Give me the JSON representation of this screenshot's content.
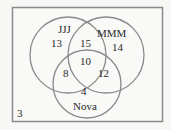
{
  "diagram": {
    "type": "venn3",
    "frame": {
      "x": 12,
      "y": 7,
      "width": 150,
      "height": 114,
      "stroke": "#8a8a8a"
    },
    "circle_stroke": "#8a8a8a",
    "sets": [
      {
        "name": "JJJ",
        "cx": 68,
        "cy": 55,
        "r": 38
      },
      {
        "name": "MMM",
        "cx": 106,
        "cy": 55,
        "r": 38
      },
      {
        "name": "Nova",
        "cx": 87,
        "cy": 84,
        "r": 34
      }
    ],
    "labels": {
      "jjj": "JJJ",
      "mmm": "MMM",
      "nova": "Nova"
    },
    "regions": {
      "jjj_only": "13",
      "mmm_only": "14",
      "nova_only": "4",
      "jjj_mmm": "15",
      "jjj_nova": "8",
      "mmm_nova": "12",
      "all_three": "10",
      "outside": "3"
    }
  }
}
